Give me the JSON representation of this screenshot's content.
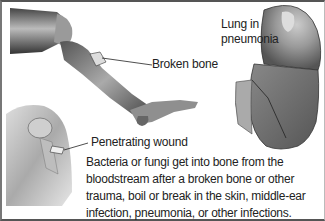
{
  "figure": {
    "labels": {
      "lung": [
        "Lung in",
        "pneumonia"
      ],
      "broken_bone": "Broken bone",
      "penetrating_wound": "Penetrating wound"
    },
    "caption": "Bacteria or fungi get into bone from the bloodstream after a broken bone or other trauma, boil or break in the skin, middle-ear infection, pneumonia, or other infections.",
    "illustrations": [
      {
        "name": "leg-with-fracture",
        "style": "grayscale anatomical"
      },
      {
        "name": "lung-in-pneumonia",
        "style": "grayscale anatomical"
      },
      {
        "name": "shoulder-with-penetrating-wound",
        "style": "grayscale anatomical"
      }
    ],
    "colors": {
      "ink": "#222222",
      "border": "#555555",
      "background": "#ffffff"
    }
  }
}
